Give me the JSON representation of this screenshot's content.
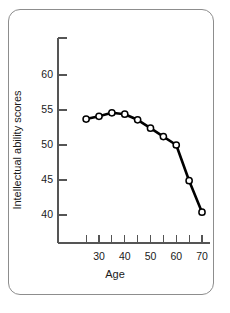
{
  "figure": {
    "frame": "rounded-rectangle-border",
    "background_color": "#ffffff",
    "line_color": "#000000",
    "axis_color": "#555555",
    "marker_fill": "#ffffff"
  },
  "chart_data": {
    "type": "line",
    "title": "",
    "xlabel": "Age",
    "ylabel": "Intellectual ability scores",
    "x": [
      25,
      30,
      35,
      40,
      45,
      50,
      55,
      60,
      65,
      70
    ],
    "values": [
      53.7,
      54.1,
      54.6,
      54.4,
      53.6,
      52.4,
      51.2,
      50.0,
      44.9,
      40.4
    ],
    "series": [
      {
        "name": "Intellectual ability",
        "values": [
          53.7,
          54.1,
          54.6,
          54.4,
          53.6,
          52.4,
          51.2,
          50.0,
          44.9,
          40.4
        ]
      }
    ],
    "xlim": [
      22,
      72
    ],
    "ylim": [
      36,
      63
    ],
    "xticks_labeled": [
      30,
      40,
      50,
      60,
      70
    ],
    "xticks_minor": [
      25,
      35,
      45,
      55,
      65
    ],
    "yticks_labeled": [
      40,
      45,
      50,
      55,
      60
    ],
    "xtick_labels": [
      "30",
      "40",
      "50",
      "60",
      "70"
    ],
    "ytick_labels": [
      "40",
      "45",
      "50",
      "55",
      "60"
    ],
    "grid": false,
    "legend": null,
    "marker": "open-circle",
    "line_style": "solid"
  }
}
